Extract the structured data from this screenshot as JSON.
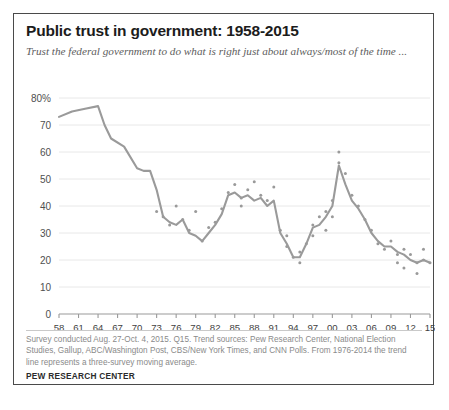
{
  "card": {
    "title": "Public trust in government: 1958-2015",
    "subtitle": "Trust the federal government to do what is right just about always/most of the time ...",
    "source_note": "Survey conducted Aug. 27-Oct. 4, 2015. Q15. Trend sources: Pew Research Center, National Election Studies, Gallup, ABC/Washington Post, CBS/New York Times, and CNN Polls. From 1976-2014 the trend line represents a three-survey moving average.",
    "brand": "PEW RESEARCH CENTER",
    "border_color": "#4a4a4a"
  },
  "chart_data": {
    "type": "line",
    "title": "Public trust in government: 1958-2015",
    "subtitle": "Trust the federal government to do what is right just about always/most of the time ...",
    "xlabel": "",
    "ylabel": "",
    "xlim": [
      1958,
      2015
    ],
    "ylim": [
      0,
      80
    ],
    "grid": true,
    "legend": "none",
    "line_color": "#9a9a9a",
    "point_color": "#9a9a9a",
    "grid_color": "#e8e8e8",
    "y_ticks": [
      0,
      10,
      20,
      30,
      40,
      50,
      60,
      70,
      80
    ],
    "y_tick_labels": [
      "0",
      "10",
      "20",
      "30",
      "40",
      "50",
      "60",
      "70",
      "80%"
    ],
    "x_ticks": [
      1958,
      1961,
      1964,
      1967,
      1970,
      1973,
      1976,
      1979,
      1982,
      1985,
      1988,
      1991,
      1994,
      1997,
      2000,
      2003,
      2006,
      2009,
      2012,
      2015
    ],
    "x_tick_labels": [
      "58",
      "61",
      "64",
      "67",
      "70",
      "73",
      "76",
      "79",
      "82",
      "85",
      "88",
      "91",
      "94",
      "97",
      "00",
      "03",
      "06",
      "09",
      "12",
      "15"
    ],
    "series": [
      {
        "name": "Trust the federal government (trend line)",
        "style": "line",
        "x": [
          1958,
          1960,
          1962,
          1964,
          1965,
          1966,
          1968,
          1970,
          1971,
          1972,
          1973,
          1974,
          1975,
          1976,
          1977,
          1978,
          1979,
          1980,
          1981,
          1982,
          1983,
          1984,
          1985,
          1986,
          1987,
          1988,
          1989,
          1990,
          1991,
          1992,
          1993,
          1994,
          1995,
          1996,
          1997,
          1998,
          1999,
          2000,
          2001,
          2002,
          2003,
          2004,
          2005,
          2006,
          2007,
          2008,
          2009,
          2010,
          2011,
          2012,
          2013,
          2014,
          2015
        ],
        "values": [
          73,
          75,
          76,
          77,
          70,
          65,
          62,
          54,
          53,
          53,
          46,
          36,
          34,
          33,
          35,
          30,
          29,
          27,
          30,
          33,
          37,
          44,
          45,
          43,
          44,
          42,
          43,
          40,
          42,
          30,
          26,
          21,
          21,
          26,
          32,
          33,
          36,
          40,
          55,
          48,
          42,
          39,
          35,
          30,
          27,
          25,
          25,
          23,
          22,
          20,
          19,
          20,
          19
        ]
      },
      {
        "name": "Individual survey readings",
        "style": "scatter",
        "points": [
          {
            "x": 1973,
            "y": 38
          },
          {
            "x": 1974,
            "y": 36
          },
          {
            "x": 1975,
            "y": 33
          },
          {
            "x": 1976,
            "y": 40
          },
          {
            "x": 1977,
            "y": 35
          },
          {
            "x": 1978,
            "y": 31
          },
          {
            "x": 1979,
            "y": 38
          },
          {
            "x": 1980,
            "y": 27
          },
          {
            "x": 1981,
            "y": 32
          },
          {
            "x": 1982,
            "y": 34
          },
          {
            "x": 1983,
            "y": 39
          },
          {
            "x": 1984,
            "y": 45
          },
          {
            "x": 1985,
            "y": 48
          },
          {
            "x": 1986,
            "y": 43
          },
          {
            "x": 1986,
            "y": 40
          },
          {
            "x": 1987,
            "y": 46
          },
          {
            "x": 1988,
            "y": 49
          },
          {
            "x": 1989,
            "y": 44
          },
          {
            "x": 1990,
            "y": 42
          },
          {
            "x": 1991,
            "y": 47
          },
          {
            "x": 1992,
            "y": 31
          },
          {
            "x": 1993,
            "y": 25
          },
          {
            "x": 1993,
            "y": 29
          },
          {
            "x": 1994,
            "y": 21
          },
          {
            "x": 1995,
            "y": 19
          },
          {
            "x": 1995,
            "y": 23
          },
          {
            "x": 1996,
            "y": 26
          },
          {
            "x": 1997,
            "y": 33
          },
          {
            "x": 1997,
            "y": 29
          },
          {
            "x": 1998,
            "y": 36
          },
          {
            "x": 1999,
            "y": 31
          },
          {
            "x": 1999,
            "y": 38
          },
          {
            "x": 2000,
            "y": 42
          },
          {
            "x": 2000,
            "y": 36
          },
          {
            "x": 2001,
            "y": 60
          },
          {
            "x": 2001,
            "y": 56
          },
          {
            "x": 2002,
            "y": 52
          },
          {
            "x": 2003,
            "y": 44
          },
          {
            "x": 2004,
            "y": 40
          },
          {
            "x": 2005,
            "y": 35
          },
          {
            "x": 2006,
            "y": 31
          },
          {
            "x": 2007,
            "y": 26
          },
          {
            "x": 2008,
            "y": 24
          },
          {
            "x": 2009,
            "y": 27
          },
          {
            "x": 2010,
            "y": 22
          },
          {
            "x": 2010,
            "y": 19
          },
          {
            "x": 2011,
            "y": 17
          },
          {
            "x": 2011,
            "y": 24
          },
          {
            "x": 2012,
            "y": 22
          },
          {
            "x": 2013,
            "y": 19
          },
          {
            "x": 2013,
            "y": 15
          },
          {
            "x": 2014,
            "y": 24
          },
          {
            "x": 2014,
            "y": 20
          },
          {
            "x": 2015,
            "y": 19
          }
        ]
      }
    ]
  }
}
